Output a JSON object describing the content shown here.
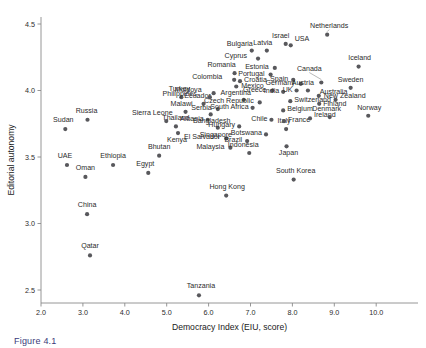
{
  "figure": {
    "caption": "Figure 4.1",
    "background_color": "#ffffff",
    "marker_color": "#58585c",
    "axis_color": "#8a8a8a",
    "text_color": "#2b2b2b"
  },
  "chart_data": {
    "type": "scatter",
    "title": "",
    "xlabel": "Democracy Index (EIU, score)",
    "ylabel": "Editorial autonomy",
    "xlim": [
      2.0,
      10.6
    ],
    "ylim": [
      2.4,
      4.62
    ],
    "xticks": [
      "2.0",
      "3.0",
      "4.0",
      "5.0",
      "6.0",
      "7.0",
      "8.0",
      "9.0",
      "10.0"
    ],
    "xtick_values": [
      2.0,
      3.0,
      4.0,
      5.0,
      6.0,
      7.0,
      8.0,
      9.0,
      10.0
    ],
    "yticks": [
      "2.5",
      "3.0",
      "3.5",
      "4.0",
      "4.5"
    ],
    "ytick_values": [
      2.5,
      3.0,
      3.5,
      4.0,
      4.5
    ],
    "grid": false,
    "legend": "none",
    "points": [
      {
        "label": "Sudan",
        "x": 2.58,
        "y": 3.71,
        "lx": -2,
        "ly": -7,
        "anchor": "middle"
      },
      {
        "label": "UAE",
        "x": 2.62,
        "y": 3.44,
        "lx": -2,
        "ly": -7,
        "anchor": "middle"
      },
      {
        "label": "Oman",
        "x": 3.06,
        "y": 3.35,
        "lx": 0,
        "ly": -7,
        "anchor": "middle"
      },
      {
        "label": "Russia",
        "x": 3.11,
        "y": 3.78,
        "lx": -1,
        "ly": -7,
        "anchor": "middle"
      },
      {
        "label": "China",
        "x": 3.1,
        "y": 3.07,
        "lx": 0,
        "ly": -7,
        "anchor": "middle"
      },
      {
        "label": "Qatar",
        "x": 3.17,
        "y": 2.76,
        "lx": 0,
        "ly": -7,
        "anchor": "middle"
      },
      {
        "label": "Ethiopia",
        "x": 3.72,
        "y": 3.44,
        "lx": 0,
        "ly": -7,
        "anchor": "middle"
      },
      {
        "label": "Egypt",
        "x": 4.56,
        "y": 3.38,
        "lx": -3,
        "ly": -7,
        "anchor": "middle"
      },
      {
        "label": "Bhutan",
        "x": 4.82,
        "y": 3.51,
        "lx": 0,
        "ly": -7,
        "anchor": "middle"
      },
      {
        "label": "Sierra Leone",
        "x": 4.99,
        "y": 3.77,
        "lx": -14,
        "ly": -6,
        "anchor": "middle"
      },
      {
        "label": "Thailand",
        "x": 5.22,
        "y": 3.73,
        "lx": 0,
        "ly": -6,
        "anchor": "middle"
      },
      {
        "label": "Malawi",
        "x": 5.45,
        "y": 3.84,
        "lx": -4,
        "ly": -6,
        "anchor": "middle"
      },
      {
        "label": "Kenya",
        "x": 5.27,
        "y": 3.68,
        "lx": -1,
        "ly": 9,
        "anchor": "middle"
      },
      {
        "label": "Turkey",
        "x": 5.35,
        "y": 3.95,
        "lx": -2,
        "ly": -6,
        "anchor": "middle"
      },
      {
        "label": "Tanzania",
        "x": 5.77,
        "y": 2.46,
        "lx": 2,
        "ly": -7,
        "anchor": "middle"
      },
      {
        "label": "Hong Kong",
        "x": 6.42,
        "y": 3.21,
        "lx": 1,
        "ly": -7,
        "anchor": "middle"
      },
      {
        "label": "Ecuador",
        "x": 5.88,
        "y": 3.9,
        "lx": -6,
        "ly": -6,
        "anchor": "middle"
      },
      {
        "label": "Philippines",
        "x": 6.03,
        "y": 3.95,
        "lx": -13,
        "ly": -1,
        "anchor": "end"
      },
      {
        "label": "Moldova",
        "x": 6.12,
        "y": 3.98,
        "lx": -12,
        "ly": -1,
        "anchor": "end"
      },
      {
        "label": "Albania",
        "x": 5.98,
        "y": 3.78,
        "lx": -4,
        "ly": 1,
        "anchor": "end"
      },
      {
        "label": "Serbia",
        "x": 6.22,
        "y": 3.86,
        "lx": -6,
        "ly": 1,
        "anchor": "end"
      },
      {
        "label": "Bangladesh",
        "x": 6.05,
        "y": 3.82,
        "lx": 1,
        "ly": 9,
        "anchor": "middle"
      },
      {
        "label": "Singapore",
        "x": 6.22,
        "y": 3.72,
        "lx": -2,
        "ly": 9,
        "anchor": "middle"
      },
      {
        "label": "El Salvador",
        "x": 6.42,
        "y": 3.64,
        "lx": -6,
        "ly": 1,
        "anchor": "end"
      },
      {
        "label": "Malaysia",
        "x": 6.52,
        "y": 3.57,
        "lx": -6,
        "ly": 1,
        "anchor": "end"
      },
      {
        "label": "Colombia",
        "x": 6.61,
        "y": 4.08,
        "lx": -12,
        "ly": -1,
        "anchor": "end"
      },
      {
        "label": "Romania",
        "x": 6.62,
        "y": 4.13,
        "lx": -13,
        "ly": -6,
        "anchor": "middle"
      },
      {
        "label": "Argentina",
        "x": 6.84,
        "y": 3.93,
        "lx": -8,
        "ly": -5,
        "anchor": "middle"
      },
      {
        "label": "Mexico",
        "x": 6.66,
        "y": 4.03,
        "lx": 5,
        "ly": 1,
        "anchor": "start"
      },
      {
        "label": "Hungary",
        "x": 6.73,
        "y": 3.73,
        "lx": -4,
        "ly": 1,
        "anchor": "end"
      },
      {
        "label": "Brazil",
        "x": 6.92,
        "y": 3.62,
        "lx": -5,
        "ly": 1,
        "anchor": "end"
      },
      {
        "label": "Indonesia",
        "x": 6.97,
        "y": 3.53,
        "lx": -6,
        "ly": -6,
        "anchor": "middle"
      },
      {
        "label": "Croatia",
        "x": 6.75,
        "y": 4.07,
        "lx": 4,
        "ly": 1,
        "anchor": "start"
      },
      {
        "label": "Bulgaria",
        "x": 7.03,
        "y": 4.3,
        "lx": -12,
        "ly": -5,
        "anchor": "middle"
      },
      {
        "label": "Cyprus",
        "x": 7.18,
        "y": 4.24,
        "lx": -11,
        "ly": -1,
        "anchor": "end"
      },
      {
        "label": "South Africa",
        "x": 7.05,
        "y": 3.87,
        "lx": -4,
        "ly": 1,
        "anchor": "end"
      },
      {
        "label": "Czech Republic",
        "x": 7.22,
        "y": 3.91,
        "lx": -6,
        "ly": 1,
        "anchor": "end"
      },
      {
        "label": "Botswana",
        "x": 7.37,
        "y": 3.67,
        "lx": -4,
        "ly": 1,
        "anchor": "end"
      },
      {
        "label": "Latvia",
        "x": 7.39,
        "y": 4.3,
        "lx": -4,
        "ly": -6,
        "anchor": "middle"
      },
      {
        "label": "Portugal",
        "x": 7.48,
        "y": 4.12,
        "lx": -6,
        "ly": 1,
        "anchor": "end"
      },
      {
        "label": "Estonia",
        "x": 7.58,
        "y": 4.17,
        "lx": -6,
        "ly": 1,
        "anchor": "end"
      },
      {
        "label": "Greece",
        "x": 7.52,
        "y": 4.0,
        "lx": -6,
        "ly": 1,
        "anchor": "end"
      },
      {
        "label": "Chile",
        "x": 7.5,
        "y": 3.78,
        "lx": -4,
        "ly": 1,
        "anchor": "end"
      },
      {
        "label": "Japan",
        "x": 7.86,
        "y": 3.58,
        "lx": 2,
        "ly": 9,
        "anchor": "middle"
      },
      {
        "label": "South Korea",
        "x": 8.03,
        "y": 3.33,
        "lx": 2,
        "ly": -7,
        "anchor": "middle"
      },
      {
        "label": "Israel",
        "x": 7.84,
        "y": 4.35,
        "lx": -5,
        "ly": -6,
        "anchor": "middle"
      },
      {
        "label": "USA",
        "x": 7.96,
        "y": 4.34,
        "lx": 4,
        "ly": -4,
        "anchor": "start"
      },
      {
        "label": "Spain",
        "x": 8.02,
        "y": 4.08,
        "lx": -5,
        "ly": 1,
        "anchor": "end"
      },
      {
        "label": "India",
        "x": 7.78,
        "y": 3.99,
        "lx": -4,
        "ly": 1,
        "anchor": "end"
      },
      {
        "label": "Italy",
        "x": 7.85,
        "y": 3.71,
        "lx": -2,
        "ly": -6,
        "anchor": "middle"
      },
      {
        "label": "France",
        "x": 7.8,
        "y": 3.77,
        "lx": 4,
        "ly": 1,
        "anchor": "start"
      },
      {
        "label": "Belgium",
        "x": 7.78,
        "y": 3.85,
        "lx": 4,
        "ly": 1,
        "anchor": "start"
      },
      {
        "label": "Switzerland",
        "x": 7.95,
        "y": 3.92,
        "lx": 4,
        "ly": 1,
        "anchor": "start"
      },
      {
        "label": "UK",
        "x": 8.1,
        "y": 4.0,
        "lx": -4,
        "ly": 1,
        "anchor": "end"
      },
      {
        "label": "Germany",
        "x": 8.2,
        "y": 4.05,
        "lx": -6,
        "ly": 1,
        "anchor": "end"
      },
      {
        "label": "Austria",
        "x": 8.37,
        "y": 4.0,
        "lx": -5,
        "ly": -6,
        "anchor": "middle"
      },
      {
        "label": "Ireland",
        "x": 8.42,
        "y": 3.79,
        "lx": 4,
        "ly": -1,
        "anchor": "start"
      },
      {
        "label": "Canada",
        "x": 8.69,
        "y": 4.06,
        "lx": -12,
        "ly": -12,
        "anchor": "middle",
        "leader": true
      },
      {
        "label": "Netherlands",
        "x": 8.83,
        "y": 4.42,
        "lx": 2,
        "ly": -7,
        "anchor": "middle",
        "leader": true
      },
      {
        "label": "Denmark",
        "x": 8.89,
        "y": 3.8,
        "lx": -3,
        "ly": -6,
        "anchor": "middle"
      },
      {
        "label": "New Zealand",
        "x": 8.63,
        "y": 3.96,
        "lx": 5,
        "ly": 2,
        "anchor": "start"
      },
      {
        "label": "Finland",
        "x": 8.64,
        "y": 3.9,
        "lx": 4,
        "ly": 2,
        "anchor": "start"
      },
      {
        "label": "Australia",
        "x": 9.03,
        "y": 3.93,
        "lx": -2,
        "ly": -6,
        "anchor": "middle"
      },
      {
        "label": "Sweden",
        "x": 9.39,
        "y": 4.02,
        "lx": 0,
        "ly": -6,
        "anchor": "middle"
      },
      {
        "label": "Norway",
        "x": 9.81,
        "y": 3.81,
        "lx": 1,
        "ly": -6,
        "anchor": "middle"
      },
      {
        "label": "Iceland",
        "x": 9.58,
        "y": 4.18,
        "lx": 1,
        "ly": -7,
        "anchor": "middle"
      }
    ]
  }
}
